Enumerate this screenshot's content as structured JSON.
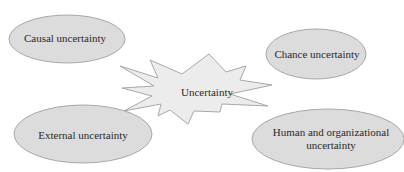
{
  "diagram": {
    "center": {
      "label": "Uncertainty",
      "shape": "starburst"
    },
    "nodes": [
      {
        "id": "causal",
        "label": "Causal uncertainty",
        "position": "top-left"
      },
      {
        "id": "chance",
        "label": "Chance uncertainty",
        "position": "top-right"
      },
      {
        "id": "external",
        "label": "External uncertainty",
        "position": "bottom-left"
      },
      {
        "id": "human",
        "label_line1": "Human and organizational",
        "label_line2": "uncertainty",
        "position": "bottom-right"
      }
    ],
    "colors": {
      "fill": "#dcdcdc",
      "stroke": "#a8a8a8",
      "center_fill": "#ececec",
      "text": "#2a2a2a"
    }
  }
}
